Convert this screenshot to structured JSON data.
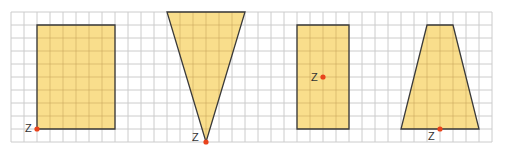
{
  "grid": {
    "origin_x": 11,
    "origin_y": 12,
    "cell": 13,
    "cols": 37,
    "rows": 10,
    "line_color": "#cccccc",
    "inner_line_color": "#c9a65a"
  },
  "colors": {
    "fill": "#f9de8c",
    "stroke": "#3a3a3a",
    "point": "#e8431c",
    "label": "#333333"
  },
  "shapes": [
    {
      "name": "rectangle-wide",
      "type": "polygon",
      "points_grid": [
        [
          2,
          1
        ],
        [
          8,
          1
        ],
        [
          8,
          9
        ],
        [
          2,
          9
        ]
      ],
      "point_z": [
        2,
        9
      ],
      "label": "Z",
      "label_offset": [
        -12,
        3
      ]
    },
    {
      "name": "triangle-inverted",
      "type": "polygon",
      "points_grid": [
        [
          12,
          0
        ],
        [
          18,
          0
        ],
        [
          15,
          10
        ]
      ],
      "point_z": [
        15,
        10
      ],
      "label": "Z",
      "label_offset": [
        -14,
        -1
      ]
    },
    {
      "name": "rectangle-narrow",
      "type": "polygon",
      "points_grid": [
        [
          22,
          1
        ],
        [
          26,
          1
        ],
        [
          26,
          9
        ],
        [
          22,
          9
        ]
      ],
      "point_z": [
        24,
        5
      ],
      "label": "Z",
      "label_offset": [
        -12,
        4
      ]
    },
    {
      "name": "trapezoid",
      "type": "polygon",
      "points_grid": [
        [
          32,
          1
        ],
        [
          34,
          1
        ],
        [
          36,
          9
        ],
        [
          30,
          9
        ]
      ],
      "point_z": [
        33,
        9
      ],
      "label": "Z",
      "label_offset": [
        -12,
        11
      ]
    }
  ]
}
